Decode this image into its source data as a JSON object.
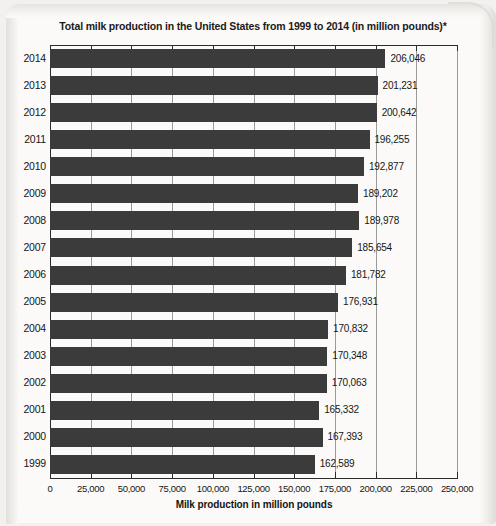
{
  "chart_data": {
    "type": "bar",
    "orientation": "horizontal",
    "title": "Total milk production in the United States from 1999 to 2014 (in million pounds)*",
    "xlabel": "Milk production in million pounds",
    "ylabel": "",
    "xlim": [
      0,
      250000
    ],
    "xticks": [
      0,
      25000,
      50000,
      75000,
      100000,
      125000,
      150000,
      175000,
      200000,
      225000,
      250000
    ],
    "xtick_labels": [
      "0",
      "25,000",
      "50,000",
      "75,000",
      "100,000",
      "125,000",
      "150,000",
      "175,000",
      "200,000",
      "225,000",
      "250,000"
    ],
    "grid": true,
    "legend": null,
    "bar_color": "#3b3b3b",
    "categories": [
      "2014",
      "2013",
      "2012",
      "2011",
      "2010",
      "2009",
      "2008",
      "2007",
      "2006",
      "2005",
      "2004",
      "2003",
      "2002",
      "2001",
      "2000",
      "1999"
    ],
    "values": [
      206046,
      201231,
      200642,
      196255,
      192877,
      189202,
      189978,
      185654,
      181782,
      176931,
      170832,
      170348,
      170063,
      165332,
      167393,
      162589
    ],
    "value_labels": [
      "206,046",
      "201,231",
      "200,642",
      "196,255",
      "192,877",
      "189,202",
      "189,978",
      "185,654",
      "181,782",
      "176,931",
      "170,832",
      "170,348",
      "170,063",
      "165,332",
      "167,393",
      "162,589"
    ]
  }
}
